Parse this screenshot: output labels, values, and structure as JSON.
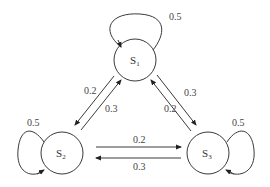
{
  "diagram": {
    "type": "markov-chain-state-transition",
    "states": [
      {
        "id": "S1",
        "label": "S",
        "sub": "1"
      },
      {
        "id": "S2",
        "label": "S",
        "sub": "2"
      },
      {
        "id": "S3",
        "label": "S",
        "sub": "3"
      }
    ],
    "transitions": [
      {
        "from": "S1",
        "to": "S1",
        "p": "0.5"
      },
      {
        "from": "S2",
        "to": "S2",
        "p": "0.5"
      },
      {
        "from": "S3",
        "to": "S3",
        "p": "0.5"
      },
      {
        "from": "S1",
        "to": "S2",
        "p": "0.2"
      },
      {
        "from": "S2",
        "to": "S1",
        "p": "0.3"
      },
      {
        "from": "S3",
        "to": "S1",
        "p": "0.2"
      },
      {
        "from": "S1",
        "to": "S3",
        "p": "0.3"
      },
      {
        "from": "S2",
        "to": "S3",
        "p": "0.2"
      },
      {
        "from": "S3",
        "to": "S2",
        "p": "0.3"
      }
    ]
  },
  "colors": {
    "line": "#3a3a3a",
    "text": "#444444"
  }
}
